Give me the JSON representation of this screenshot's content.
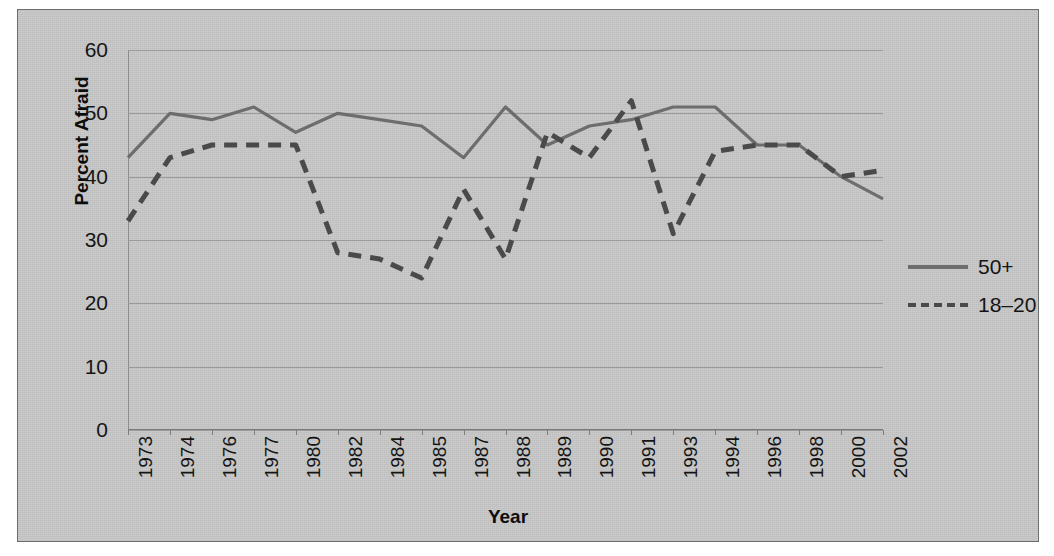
{
  "chart_data": {
    "type": "line",
    "title": "",
    "xlabel": "Year",
    "ylabel": "Percent Afraid",
    "ylim": [
      0,
      60
    ],
    "yticks": [
      0,
      10,
      20,
      30,
      40,
      50,
      60
    ],
    "grid": true,
    "legend_position": "right",
    "categories": [
      "1973",
      "1974",
      "1976",
      "1977",
      "1980",
      "1982",
      "1984",
      "1985",
      "1987",
      "1988",
      "1989",
      "1990",
      "1991",
      "1993",
      "1994",
      "1996",
      "1998",
      "2000",
      "2002"
    ],
    "series": [
      {
        "name": "50+",
        "style": "solid",
        "color": "#6d6d6d",
        "values": [
          43,
          50,
          49,
          51,
          47,
          50,
          49,
          48,
          43,
          51,
          45,
          48,
          49,
          51,
          51,
          45,
          45,
          40,
          36.5
        ]
      },
      {
        "name": "18–20",
        "style": "dashed",
        "color": "#4a4a4a",
        "values": [
          33,
          43,
          45,
          45,
          45,
          28,
          27,
          24,
          38,
          27,
          47,
          43,
          52,
          31,
          44,
          45,
          45,
          40,
          41
        ]
      }
    ]
  },
  "figure": {
    "background": "#c9c9c9",
    "border_color": "#6e6e6e",
    "gridline_color": "#9a9a9a"
  },
  "legend": {
    "entries": [
      {
        "label": "50+",
        "style": "solid"
      },
      {
        "label": "18–20",
        "style": "dashed"
      }
    ]
  }
}
